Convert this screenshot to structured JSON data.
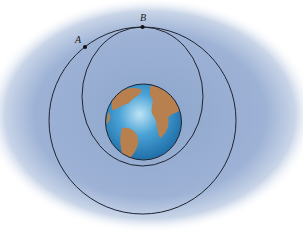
{
  "figure": {
    "labels": {
      "point_a": "A",
      "point_b": "B"
    },
    "colors": {
      "background_glow": "#9fb4d6",
      "orbit_line": "#1f2430",
      "ocean": "#3a8fc9",
      "land": "#b8804f",
      "point": "#111111"
    },
    "geometry": {
      "circular_orbit": {
        "cx": 142.5,
        "cy": 120.5,
        "r": 93.5
      },
      "elliptical_orbit": {
        "cx": 142.5,
        "cy": 96.5,
        "rx": 60.5,
        "ry": 69.5
      },
      "earth": {
        "cx": 143.5,
        "cy": 122,
        "r": 38
      },
      "point_a": {
        "x": 85,
        "y": 47
      },
      "point_b": {
        "x": 142.5,
        "y": 27
      }
    }
  }
}
